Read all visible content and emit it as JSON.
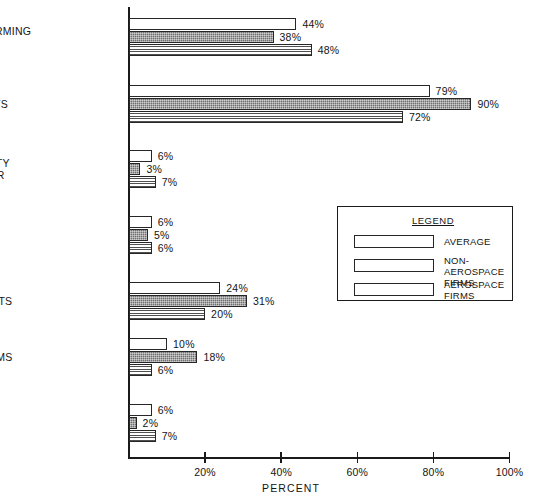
{
  "chart_data": {
    "type": "bar",
    "orientation": "horizontal",
    "title": "",
    "xlabel": "PERCENT",
    "ylabel": "",
    "xlim": [
      0,
      100
    ],
    "xticks": [
      "20%",
      "40%",
      "60%",
      "80%",
      "100%"
    ],
    "xtick_values": [
      20,
      40,
      60,
      80,
      100
    ],
    "grid": false,
    "legend_position": "right-middle",
    "categories": [
      "BRAINSTORMING\nSESSIONS",
      "CHECKLISTS",
      "COMPLEXITY\nAQNALYZER",
      "DATABASE\nANALYZER",
      "ERROR LISTS",
      "HISTOGRAMS",
      "LOGIC\nANALYZER"
    ],
    "series": [
      {
        "name": "AVERAGE",
        "style": "white",
        "values": [
          44,
          79,
          6,
          6,
          24,
          10,
          6
        ],
        "labels": [
          "44%",
          "79%",
          "6%",
          "6%",
          "24%",
          "10%",
          "6%"
        ]
      },
      {
        "name": "NON-AEROSPACE\nFIRMS",
        "style": "dark-stipple",
        "values": [
          38,
          90,
          3,
          5,
          31,
          18,
          2
        ],
        "labels": [
          "38%",
          "90%",
          "3%",
          "5%",
          "31%",
          "18%",
          "2%"
        ]
      },
      {
        "name": "AEROSPACE\nFIRMS",
        "style": "horizontal-lines",
        "values": [
          48,
          72,
          7,
          6,
          20,
          6,
          7
        ],
        "labels": [
          "48%",
          "72%",
          "7%",
          "6%",
          "20%",
          "6%",
          "7%"
        ]
      }
    ]
  },
  "legend": {
    "title": "LEGEND",
    "entries": [
      {
        "label": "AVERAGE"
      },
      {
        "label": "NON-AEROSPACE\nFIRMS"
      },
      {
        "label": "AEROSPACE\nFIRMS"
      }
    ]
  },
  "colors": {
    "axis": "#1a1a1a",
    "bar_outline": "#262626",
    "average_fill": "#ffffff",
    "nonaerospace_fill": "#6e6e6e",
    "aerospace_fill": "#ffffff",
    "aerospace_lines": "#505050",
    "text": "#141414",
    "background": "#ffffff"
  }
}
